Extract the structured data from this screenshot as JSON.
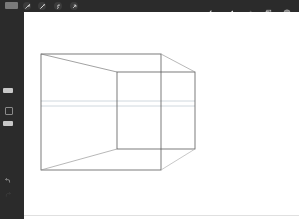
{
  "topbar": {
    "gallery_label": "Gallery",
    "left_tools": [
      {
        "name": "actions-wrench-icon"
      },
      {
        "name": "adjustments-wand-icon"
      },
      {
        "name": "selection-s-icon"
      },
      {
        "name": "transform-arrow-icon"
      }
    ],
    "right_tools": [
      {
        "name": "brush-icon"
      },
      {
        "name": "smudge-icon"
      },
      {
        "name": "eraser-icon"
      },
      {
        "name": "layers-icon"
      },
      {
        "name": "color-swatch-icon"
      }
    ],
    "colors": {
      "bar": "#2b2b2b",
      "active_color": "#8a8a8a"
    }
  },
  "sidebar": {
    "brush_size_slider": {
      "top": 88
    },
    "opacity_slider": {
      "top": 121
    },
    "modify_button": "square-modify-icon",
    "undo": "undo-icon",
    "redo": "redo-icon"
  },
  "canvas": {
    "background": "#ffffff",
    "drawing": {
      "stroke_color": "#555555",
      "guide_color": "#b8c8d4",
      "back_rect": {
        "x1": 17,
        "y1": 42,
        "x2": 137,
        "y2": 158
      },
      "front_rect": {
        "x1": 93,
        "y1": 60,
        "x2": 171,
        "y2": 137
      },
      "guides_y": [
        89,
        94
      ]
    }
  }
}
